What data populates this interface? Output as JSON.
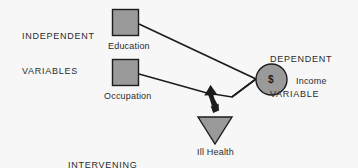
{
  "diagram": {
    "background_color": "#f7f7f7",
    "shape_fill_color": "#9a9a9a",
    "shape_stroke_color": "#1c1c1c",
    "text_color": "#2b2b2b",
    "groups": [
      {
        "id": "independent",
        "line1": "INDEPENDENT",
        "line2": "VARIABLES",
        "x": 22,
        "y": 8
      },
      {
        "id": "dependent",
        "line1": "DEPENDENT",
        "line2": "VARIABLE",
        "x": 270,
        "y": 31
      },
      {
        "id": "intervening",
        "line1": "INTERVENING",
        "line2": "VARIABLE",
        "x": 68,
        "y": 137
      }
    ],
    "nodes": [
      {
        "id": "education",
        "label": "Education",
        "shape": "square",
        "label_x": 108,
        "label_y": 41
      },
      {
        "id": "occupation",
        "label": "Occupation",
        "shape": "square",
        "label_x": 104,
        "label_y": 91
      },
      {
        "id": "income",
        "label": "Income",
        "shape": "circle",
        "glyph": "$",
        "label_x": 296,
        "label_y": 76
      },
      {
        "id": "ill-health",
        "label": "Ill Health",
        "shape": "triangle-down",
        "label_x": 197,
        "label_y": 147
      }
    ],
    "links": [
      {
        "id": "education-to-income",
        "from": "education",
        "to": "income",
        "arrowhead": false
      },
      {
        "id": "occupation-to-income",
        "from": "occupation",
        "to": "income",
        "arrowhead": false
      },
      {
        "id": "ill-health-to-path",
        "from": "ill-health",
        "to": "income-path",
        "arrowhead": true
      }
    ]
  }
}
